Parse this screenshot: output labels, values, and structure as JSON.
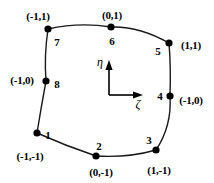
{
  "figure": {
    "line_color": "#1a1a1a",
    "node_color": "#000000",
    "background": "#ffffff"
  },
  "axes": {
    "eta": {
      "label": "η",
      "x": 100,
      "y": 62
    },
    "zeta": {
      "label": "ζ",
      "x": 138,
      "y": 104
    },
    "origin": {
      "x": 109,
      "y": 95
    },
    "eta_tip": {
      "x": 109,
      "y": 60
    },
    "zeta_tip": {
      "x": 143,
      "y": 95
    }
  },
  "nodes": [
    {
      "id": "1",
      "number": "1",
      "coord": "(-1,-1)",
      "x": 37,
      "y": 133,
      "num_x": 48,
      "num_y": 135,
      "coord_x": 30,
      "coord_y": 156
    },
    {
      "id": "2",
      "number": "2",
      "coord": "(0,-1)",
      "x": 96,
      "y": 156,
      "num_x": 99,
      "num_y": 146,
      "coord_x": 101,
      "coord_y": 172
    },
    {
      "id": "3",
      "number": "3",
      "coord": "(1,-1)",
      "x": 156,
      "y": 150,
      "num_x": 149,
      "num_y": 140,
      "coord_x": 159,
      "coord_y": 170
    },
    {
      "id": "4",
      "number": "4",
      "coord": "(-1,0)",
      "x": 170,
      "y": 96,
      "num_x": 160,
      "num_y": 96,
      "coord_x": 191,
      "coord_y": 100
    },
    {
      "id": "5",
      "number": "5",
      "coord": "(1,1)",
      "x": 169,
      "y": 43,
      "num_x": 158,
      "num_y": 51,
      "coord_x": 191,
      "coord_y": 45
    },
    {
      "id": "6",
      "number": "6",
      "coord": "(0,1)",
      "x": 111,
      "y": 27,
      "num_x": 112,
      "num_y": 41,
      "coord_x": 112,
      "coord_y": 15
    },
    {
      "id": "7",
      "number": "7",
      "coord": "(-1,1)",
      "x": 48,
      "y": 29,
      "num_x": 57,
      "num_y": 42,
      "coord_x": 38,
      "coord_y": 16
    },
    {
      "id": "8",
      "number": "8",
      "coord": "(-1,0)",
      "x": 46,
      "y": 81,
      "num_x": 57,
      "num_y": 84,
      "coord_x": 22,
      "coord_y": 80
    }
  ],
  "element_outline": {
    "path": "M 37 133 Q 66 146 96 156 Q 128 158 156 150 Q 172 126 170 96 Q 171 68 169 43 Q 139 26 111 27 Q 79 22 48 29 Q 44 56 46 81 Q 41 108 37 133"
  }
}
